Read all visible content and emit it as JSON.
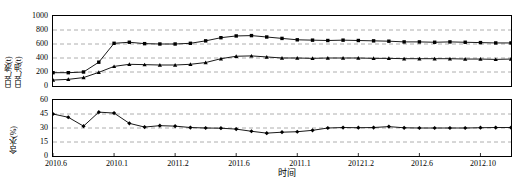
{
  "figure": {
    "background": "#ffffff",
    "line_color": "#000000",
    "grid_color": "#999999",
    "axis_color": "#000000"
  },
  "xaxis": {
    "title": "时间",
    "tick_labels": [
      "2010.6",
      "2010.1",
      "2011.2",
      "2011.6",
      "2011.1",
      "20121.2",
      "2012.6",
      "2012.10"
    ],
    "tick_positions": [
      0,
      4,
      8,
      12,
      16,
      20,
      24,
      28
    ],
    "range": [
      0,
      30
    ]
  },
  "chart_data": [
    {
      "type": "line",
      "title": "",
      "id": "production-chart",
      "xlabel": "",
      "ylabel": "日产液(t)\n日产油(t)",
      "ylabel_lines": [
        "日产液(t)",
        "日产油(t)"
      ],
      "ylim": [
        0,
        1000
      ],
      "yticks": [
        0,
        200,
        400,
        600,
        800,
        1000
      ],
      "ytick_labels": [
        "0",
        "200",
        "400",
        "600",
        "800",
        "1000"
      ],
      "grid": true,
      "grid_style": "dashed-horizontal",
      "legend": "none",
      "x": [
        0,
        1,
        2,
        3,
        4,
        5,
        6,
        7,
        8,
        9,
        10,
        11,
        12,
        13,
        14,
        15,
        16,
        17,
        18,
        19,
        20,
        21,
        22,
        23,
        24,
        25,
        26,
        27,
        28,
        29,
        30
      ],
      "series": [
        {
          "name": "日产液(t)",
          "marker": "square",
          "values": [
            190,
            190,
            200,
            340,
            610,
            625,
            605,
            600,
            600,
            610,
            645,
            690,
            715,
            720,
            700,
            680,
            660,
            655,
            650,
            655,
            650,
            645,
            640,
            630,
            630,
            625,
            630,
            625,
            620,
            615,
            615
          ]
        },
        {
          "name": "日产油(t)",
          "marker": "triangle",
          "values": [
            85,
            95,
            120,
            195,
            280,
            310,
            305,
            300,
            300,
            310,
            335,
            390,
            425,
            430,
            415,
            400,
            400,
            395,
            400,
            400,
            400,
            395,
            395,
            390,
            390,
            390,
            390,
            385,
            385,
            380,
            385
          ]
        }
      ]
    },
    {
      "type": "line",
      "title": "",
      "id": "water-cut-chart",
      "xlabel": "",
      "ylabel": "含水(%)",
      "ylim": [
        0,
        60
      ],
      "yticks": [
        0,
        15,
        30,
        45,
        60
      ],
      "ytick_labels": [
        "0",
        "15",
        "30",
        "45",
        "60"
      ],
      "grid": true,
      "grid_style": "dashed-horizontal",
      "legend": "none",
      "x": [
        0,
        1,
        2,
        3,
        4,
        5,
        6,
        7,
        8,
        9,
        10,
        11,
        12,
        13,
        14,
        15,
        16,
        17,
        18,
        19,
        20,
        21,
        22,
        23,
        24,
        25,
        26,
        27,
        28,
        29,
        30
      ],
      "series": [
        {
          "name": "含水(%)",
          "marker": "diamond",
          "values": [
            45.0,
            41.5,
            32.0,
            47.0,
            46.0,
            35.0,
            31.0,
            32.5,
            32.0,
            30.5,
            30.0,
            29.8,
            28.8,
            26.5,
            24.5,
            25.5,
            26.0,
            27.5,
            30.0,
            30.5,
            30.3,
            30.5,
            31.5,
            30.2,
            30.0,
            30.0,
            30.0,
            30.0,
            30.3,
            30.5,
            30.5
          ]
        }
      ]
    }
  ]
}
